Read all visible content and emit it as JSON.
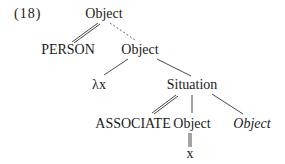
{
  "example_number": "(18)",
  "tree": {
    "root": "Object",
    "person": "PERSON",
    "object2": "Object",
    "lambda": "λx",
    "situation": "Situation",
    "associate": "ASSOCIATE",
    "object3": "Object",
    "object_italic": "Object",
    "x": "x"
  },
  "edges": [
    {
      "from": "root",
      "to": "person",
      "style": "double"
    },
    {
      "from": "root",
      "to": "object2",
      "style": "dotted"
    },
    {
      "from": "object2",
      "to": "lambda",
      "style": "single"
    },
    {
      "from": "object2",
      "to": "situation",
      "style": "single"
    },
    {
      "from": "situation",
      "to": "associate",
      "style": "double"
    },
    {
      "from": "situation",
      "to": "object3",
      "style": "single"
    },
    {
      "from": "situation",
      "to": "object_italic",
      "style": "single"
    },
    {
      "from": "object3",
      "to": "x",
      "style": "double"
    }
  ]
}
